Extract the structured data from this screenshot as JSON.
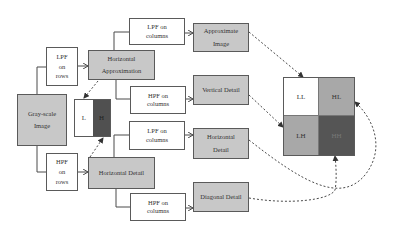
{
  "diagram": {
    "title": "",
    "nodes": {
      "input": {
        "line1": "Gray-scale",
        "line2": "Image"
      },
      "lpf_rows": {
        "line1": "LPF",
        "line2": "on",
        "line3": "rows"
      },
      "hpf_rows": {
        "line1": "HPF",
        "line2": "on",
        "line3": "rows"
      },
      "horiz_approx": {
        "line1": "Horizontal",
        "line2": "Approximation"
      },
      "horiz_detail_mid": {
        "line1": "Horizontal Detail"
      },
      "lh_split": {
        "left": "L",
        "right": "H"
      },
      "lpf_cols_1": {
        "line1": "LPF on",
        "line2": "columns"
      },
      "hpf_cols_1": {
        "line1": "HPF on",
        "line2": "columns"
      },
      "lpf_cols_2": {
        "line1": "LPF on",
        "line2": "columns"
      },
      "hpf_cols_2": {
        "line1": "HPF on",
        "line2": "columns"
      },
      "approx_image": {
        "line1": "Approximate",
        "line2": "Image"
      },
      "vertical_detail": {
        "line1": "Vertical Detail"
      },
      "horizontal_detail": {
        "line1": "Horizontal",
        "line2": "Detail"
      },
      "diagonal_detail": {
        "line1": "Diagonal Detail"
      }
    },
    "subbands": {
      "ll": "LL",
      "hl": "HL",
      "lh": "LH",
      "hh": "HH"
    },
    "colors": {
      "box_gray": "#c8c8c8",
      "l_cell": "#ffffff",
      "h_cell": "#505050",
      "ll": "#ffffff",
      "hl": "#a8a8a8",
      "lh": "#a8a8a8",
      "hh": "#555555",
      "line": "#4a4a4a"
    }
  }
}
